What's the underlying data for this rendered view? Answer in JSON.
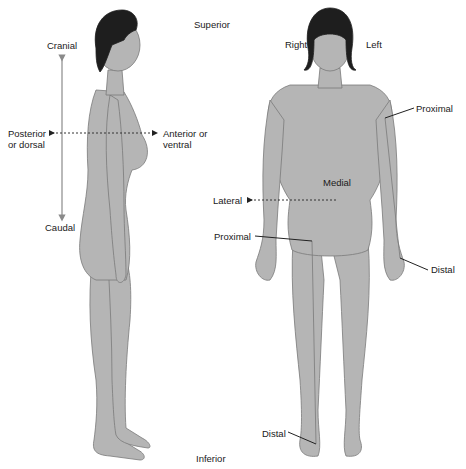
{
  "diagram": {
    "labels": {
      "superior": "Superior",
      "inferior": "Inferior",
      "cranial": "Cranial",
      "caudal": "Caudal",
      "posterior_line1": "Posterior",
      "posterior_line2": "or dorsal",
      "anterior_line1": "Anterior or",
      "anterior_line2": "ventral",
      "right": "Right",
      "left": "Left",
      "medial": "Medial",
      "lateral": "Lateral",
      "proximal_arm": "Proximal",
      "distal_arm": "Distal",
      "proximal_leg": "Proximal",
      "distal_leg": "Distal"
    },
    "figures": [
      {
        "view": "lateral (side)"
      },
      {
        "view": "anterior (front)"
      }
    ],
    "colors": {
      "skin": "#b5b5b5",
      "skin_outline": "#7a7a7a",
      "hair": "#1e1e1e",
      "axis_line": "#8a8a8a",
      "leader_line": "#222222"
    }
  }
}
